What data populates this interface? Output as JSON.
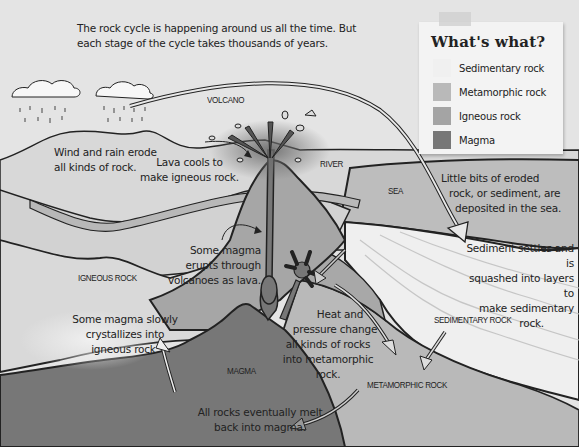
{
  "intro": {
    "line1": "The rock cycle is happening around us all the time. But",
    "line2": "each stage of the cycle takes thousands of years."
  },
  "legend": {
    "title": "What's what?",
    "items": [
      {
        "label": "Sedimentary rock",
        "color": "#f0f0f0"
      },
      {
        "label": "Metamorphic rock",
        "color": "#b9b9b9"
      },
      {
        "label": "Igneous rock",
        "color": "#a4a4a4"
      },
      {
        "label": "Magma",
        "color": "#777777"
      }
    ]
  },
  "labels": {
    "volcano": "VOLCANO",
    "river": "RIVER",
    "sea": "SEA",
    "igneous_rock": "IGNEOUS ROCK",
    "magma": "MAGMA",
    "sedimentary_rock": "SEDIMENTARY ROCK",
    "metamorphic_rock": "METAMORPHIC ROCK"
  },
  "annotations": {
    "erode": [
      "Wind and rain erode",
      "all kinds of rock."
    ],
    "lava_cools": [
      "Lava cools to",
      "make igneous rock."
    ],
    "deposited": [
      "Little bits of eroded",
      "rock, or sediment, are",
      "deposited in the sea."
    ],
    "sediment_settles": [
      "Sediment settles and is",
      "squashed into layers to",
      "make sedimentary",
      "rock."
    ],
    "erupts": [
      "Some magma",
      "erupts through",
      "volcanoes as lava."
    ],
    "crystallizes": [
      "Some magma slowly",
      "crystallizes into",
      "igneous rock."
    ],
    "heat_pressure": [
      "Heat and",
      "pressure change",
      "all kinds of rocks",
      "into metamorphic",
      "rock."
    ],
    "melt": [
      "All rocks eventually melt",
      "back into magma."
    ]
  },
  "colors": {
    "background": "#e2e2e2",
    "sky": "#e6e6e6",
    "land": "#cdcdcd",
    "sea": "#bdbdbd",
    "sedimentary": "#efefef",
    "metamorphic": "#b4b4b4",
    "igneous": "#a6a6a6",
    "magma": "#767676",
    "outline": "#1e1e1e"
  }
}
